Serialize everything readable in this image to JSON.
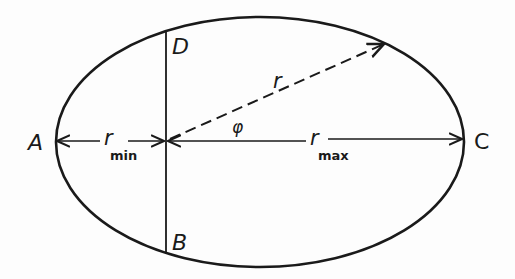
{
  "diagram": {
    "points": [
      {
        "id": "A",
        "label": "A",
        "x": 34,
        "y": 149
      },
      {
        "id": "B",
        "label": "B",
        "x": 172,
        "y": 248
      },
      {
        "id": "C",
        "label": "C",
        "x": 474,
        "y": 149
      },
      {
        "id": "D",
        "label": "D",
        "x": 172,
        "y": 54
      }
    ],
    "labels": {
      "r": "r",
      "phi": "φ",
      "r_min_main": "r",
      "r_min_sub": "min",
      "r_max_main": "r",
      "r_max_sub": "max"
    },
    "ellipse": {
      "cx": 260,
      "cy": 142,
      "rx": 204,
      "ry": 125
    },
    "focus": {
      "x": 166,
      "y": 141
    },
    "colors": {
      "stroke": "#1a1a1a",
      "background": "#fdfdfd"
    }
  }
}
